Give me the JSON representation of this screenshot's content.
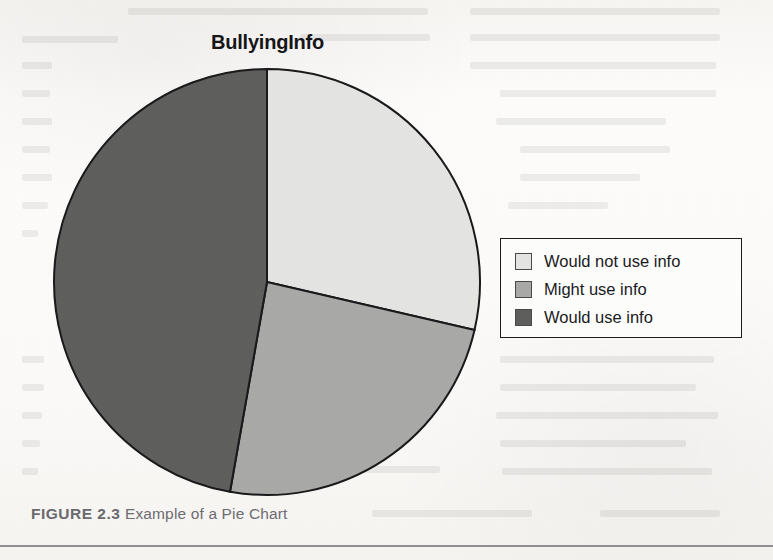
{
  "figure": {
    "caption_label": "FIGURE 2.3",
    "caption_text": "Example of a Pie Chart"
  },
  "chart_data": {
    "type": "pie",
    "title": "BullyingInfo",
    "xlabel": "",
    "ylabel": "",
    "grid": false,
    "legend_position": "right",
    "start_angle_deg": 0,
    "direction": "clockwise",
    "categories": [
      "Would not use info",
      "Might use info",
      "Would use info"
    ],
    "values": [
      28.6,
      24.2,
      47.2
    ],
    "colors": [
      "#e4e4e2",
      "#a9a9a7",
      "#5f5f5e"
    ],
    "slice_boundaries_deg": [
      0,
      103,
      190,
      360
    ],
    "edge_color": "#1a1a1c",
    "legend": [
      {
        "label": "Would not use info",
        "color": "#e4e4e2"
      },
      {
        "label": "Might use info",
        "color": "#a9a9a7"
      },
      {
        "label": "Would use info",
        "color": "#5f5f5e"
      }
    ]
  },
  "pie_geometry": {
    "center_x": 267,
    "center_y": 282,
    "radius": 213
  },
  "ghost_lines": [
    {
      "x": 128,
      "y": 8,
      "w": 300
    },
    {
      "x": 470,
      "y": 8,
      "w": 250
    },
    {
      "x": 22,
      "y": 36,
      "w": 96
    },
    {
      "x": 300,
      "y": 34,
      "w": 130
    },
    {
      "x": 470,
      "y": 34,
      "w": 250
    },
    {
      "x": 22,
      "y": 62,
      "w": 30
    },
    {
      "x": 470,
      "y": 62,
      "w": 246
    },
    {
      "x": 22,
      "y": 90,
      "w": 28
    },
    {
      "x": 500,
      "y": 90,
      "w": 216
    },
    {
      "x": 22,
      "y": 118,
      "w": 30
    },
    {
      "x": 496,
      "y": 118,
      "w": 170
    },
    {
      "x": 22,
      "y": 146,
      "w": 28
    },
    {
      "x": 520,
      "y": 146,
      "w": 150
    },
    {
      "x": 22,
      "y": 174,
      "w": 30
    },
    {
      "x": 520,
      "y": 174,
      "w": 120
    },
    {
      "x": 22,
      "y": 202,
      "w": 26
    },
    {
      "x": 508,
      "y": 202,
      "w": 100
    },
    {
      "x": 22,
      "y": 230,
      "w": 16
    },
    {
      "x": 22,
      "y": 356,
      "w": 22
    },
    {
      "x": 500,
      "y": 356,
      "w": 214
    },
    {
      "x": 22,
      "y": 384,
      "w": 22
    },
    {
      "x": 500,
      "y": 384,
      "w": 196
    },
    {
      "x": 22,
      "y": 412,
      "w": 20
    },
    {
      "x": 496,
      "y": 412,
      "w": 222
    },
    {
      "x": 22,
      "y": 440,
      "w": 18
    },
    {
      "x": 500,
      "y": 440,
      "w": 186
    },
    {
      "x": 22,
      "y": 468,
      "w": 16
    },
    {
      "x": 502,
      "y": 468,
      "w": 210
    },
    {
      "x": 330,
      "y": 466,
      "w": 110
    },
    {
      "x": 372,
      "y": 510,
      "w": 160
    },
    {
      "x": 600,
      "y": 510,
      "w": 120
    }
  ]
}
